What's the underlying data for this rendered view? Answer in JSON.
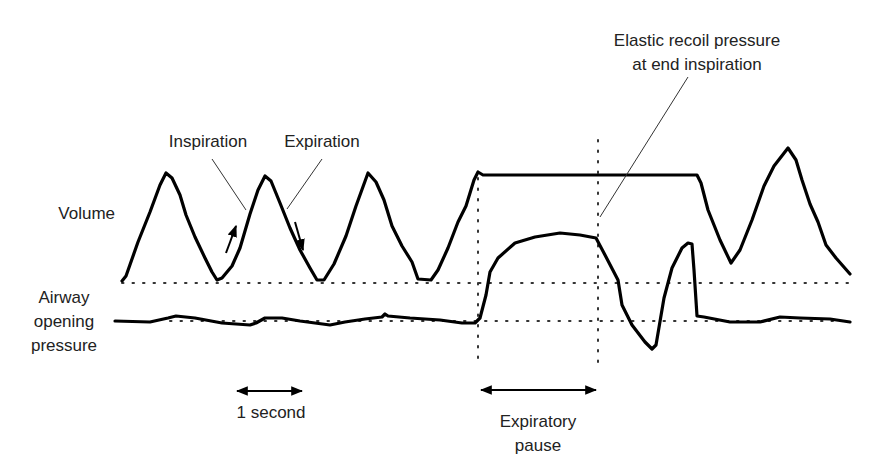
{
  "figure": {
    "type": "respiratory waveform diagram",
    "traces": [
      "Volume",
      "Airway opening pressure"
    ]
  },
  "labels": {
    "volume": "Volume",
    "airway_line1": "Airway",
    "airway_line2": "opening",
    "airway_line3": "pressure",
    "inspiration": "Inspiration",
    "expiration": "Expiration",
    "elastic_line1": "Elastic recoil pressure",
    "elastic_line2": "at end inspiration",
    "one_second": "1 second",
    "expiratory_line1": "Expiratory",
    "expiratory_line2": "pause"
  },
  "annotations": [
    {
      "text": "Inspiration",
      "points_to": "rising limb of volume trace"
    },
    {
      "text": "Expiration",
      "points_to": "falling limb of volume trace"
    },
    {
      "text": "Elastic recoil pressure at end inspiration",
      "points_to": "pressure plateau at end of expiratory pause"
    },
    {
      "text": "1 second",
      "type": "time scale bar"
    },
    {
      "text": "Expiratory pause",
      "type": "interval bar between vertical dotted lines"
    }
  ],
  "colors": {
    "trace": "#000000",
    "text": "#222222",
    "background": "#ffffff"
  }
}
